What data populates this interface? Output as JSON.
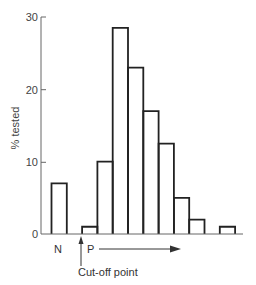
{
  "chart_data": {
    "type": "bar",
    "title": "",
    "xlabel": "",
    "ylabel": "% tested",
    "ylim": [
      0,
      30
    ],
    "yticks": [
      0,
      10,
      20,
      30
    ],
    "grid": false,
    "legend": null,
    "bins": [
      {
        "group": "N",
        "value": 7
      },
      {
        "group": "gap",
        "value": 0
      },
      {
        "group": "P",
        "value": 1
      },
      {
        "group": "P",
        "value": 10
      },
      {
        "group": "P",
        "value": 28.5
      },
      {
        "group": "P",
        "value": 23
      },
      {
        "group": "P",
        "value": 17
      },
      {
        "group": "P",
        "value": 12.5
      },
      {
        "group": "P",
        "value": 5
      },
      {
        "group": "P",
        "value": 2
      },
      {
        "group": "P",
        "value": 0
      },
      {
        "group": "P",
        "value": 1
      }
    ],
    "categories": [
      "N",
      "",
      "P1",
      "P2",
      "P3",
      "P4",
      "P5",
      "P6",
      "P7",
      "P8",
      "P9",
      "P10"
    ],
    "values": [
      7,
      0,
      1,
      10,
      28.5,
      23,
      17,
      12.5,
      5,
      2,
      0,
      1
    ],
    "annotations": [
      {
        "text": "N",
        "position": "below N bar"
      },
      {
        "text": "P",
        "position": "below first P bar, followed by right arrow"
      },
      {
        "text": "Cut-off point",
        "position": "below axis with upward arrow at N/P boundary"
      }
    ]
  },
  "labels": {
    "ylabel": "% tested",
    "tick_0": "0",
    "tick_10": "10",
    "tick_20": "20",
    "tick_30": "30",
    "n_label": "N",
    "p_label": "P",
    "cutoff_label": "Cut-off point"
  }
}
